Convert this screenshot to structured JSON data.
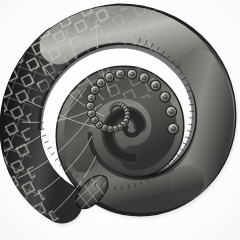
{
  "image": {
    "title": "Coiled cephalopod arm",
    "subject": "tentacle",
    "medium": "engraving",
    "style": "monochrome scientific illustration",
    "background_color": "#fbfbfa",
    "ink_color": "#2b2b2b",
    "highlight_color": "#f2f1ef",
    "midtone_color": "#6d6d6d",
    "shadow_color": "#1a1a1a",
    "net_line_color": "#d8d6d0"
  },
  "composition": {
    "orientation": "spiral coiled counter-clockwise inward",
    "center_x": 116,
    "center_y": 112,
    "outer_radius": 104,
    "inner_radius": 9,
    "turns": 1.85,
    "thick_end": "lower-left",
    "tip": "center"
  },
  "parts": [
    {
      "name": "arm-base",
      "label": "Thick cut base of arm",
      "surface": "diamond net reticulation",
      "tone": "dark"
    },
    {
      "name": "outer-coil",
      "label": "Outer whorl of arm",
      "surface": "reticulated skin fading to smooth",
      "tone": "dark to mid"
    },
    {
      "name": "inner-coil",
      "label": "Inner whorl of arm",
      "surface": "smooth with sucker row",
      "tone": "mid"
    },
    {
      "name": "sucker-row",
      "label": "Row of suckers along inner margin",
      "surface": "ringed circular suckers",
      "tone": "mid to dark"
    },
    {
      "name": "arm-tip",
      "label": "Tapering tip at spiral centre",
      "surface": "smooth",
      "tone": "dark"
    }
  ],
  "suckers": {
    "count": 34,
    "shape": "ring with dark centre",
    "min_diameter_px": 2,
    "max_diameter_px": 11
  },
  "texture": {
    "net_pattern": "crosshatched diamond lattice",
    "net_extent_degrees": 200,
    "stipple": "fine aquatint grain"
  }
}
